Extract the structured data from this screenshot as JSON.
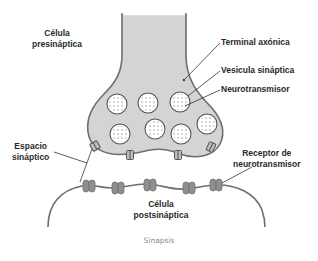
{
  "diagram": {
    "title": "Sinapsis",
    "labels": {
      "presynaptic_cell": [
        "Célula",
        "presináptica"
      ],
      "axon_terminal": "Terminal axónica",
      "synaptic_vesicle": "Vesicula sináptica",
      "neurotransmitter": "Neurotransmisor",
      "synaptic_cleft": [
        "Espacio",
        "sináptico"
      ],
      "postsynaptic_cell": [
        "Célula",
        "postsináptica"
      ],
      "receptor": [
        "Receptor de",
        "neurotransmisor"
      ]
    },
    "colors": {
      "cell_fill": "#d4d4d4",
      "outline": "#6e6e6e",
      "vesicle_fill": "#ffffff",
      "receptor_fill": "#8f8f8f",
      "text": "#2a2a2a",
      "caption": "#8a8a8a"
    },
    "vesicle_count": 8,
    "release_site_count": 4,
    "receptor_count": 5
  }
}
